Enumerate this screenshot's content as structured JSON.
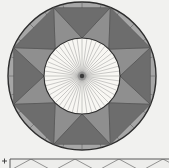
{
  "figure": {
    "title_semantic": "annulus-with-inscribed-triangle-strip-diagram",
    "width": 169,
    "height": 168,
    "background": "#f1f1ef",
    "circle": {
      "cx": 82,
      "cy": 76,
      "outer_r": 74,
      "inner_r": 38,
      "outline_color": "#2d2d2d",
      "outer_stroke_width": 1.4,
      "inner_stroke_width": 1.1
    },
    "annulus": {
      "fill": "#a6a6a6",
      "sector_count": 24,
      "sector_line_color": "#5e5e5e",
      "sector_line_width": 0.55
    },
    "zigzag": {
      "point_count": 8,
      "inner_offset_deg": 0,
      "outer_offset_deg": 22.5,
      "inward_fill": "#6d6d6d",
      "outward_fill": "#8f8f8f",
      "edge_color": "#4a4a4a",
      "edge_width": 0.5
    },
    "disk": {
      "fill": "#f8f7f3",
      "spoke_count": 48,
      "spoke_color": "#8d8d8d",
      "spoke_width": 0.45,
      "center_dot_color": "#3a3a3a",
      "center_dot_r": 2.2,
      "center_halo_color": "#777777",
      "center_halo_r": 4.5
    },
    "strip": {
      "x": 10,
      "y": 159,
      "width": 159,
      "height": 9,
      "fill": "#ededeb",
      "top_edge_color": "#4a4a4a",
      "left_edge_color": "#4a4a4a",
      "line_color": "#6a6a6a",
      "line_width": 0.7,
      "first_peak_x": 31,
      "peak_spacing": 44,
      "peak_y": 159,
      "base_y": 171,
      "peak_count": 4
    },
    "marker": {
      "symbol": "plus",
      "x": 4.5,
      "y": 161,
      "size": 5,
      "color": "#333333",
      "stroke_width": 0.9
    }
  }
}
